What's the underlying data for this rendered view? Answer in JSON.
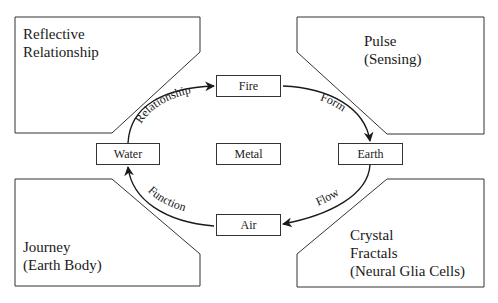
{
  "panels": {
    "top_left": {
      "line1": "Reflective",
      "line2": "Relationship"
    },
    "top_right": {
      "line1": "Pulse",
      "line2": "(Sensing)"
    },
    "bottom_left": {
      "line1": "Journey",
      "line2": "(Earth Body)"
    },
    "bottom_right": {
      "line1": "Crystal",
      "line2": "Fractals",
      "line3": "(Neural Glia Cells)"
    }
  },
  "nodes": {
    "fire": "Fire",
    "water": "Water",
    "metal": "Metal",
    "earth": "Earth",
    "air": "Air"
  },
  "arrows": {
    "water_to_fire": "Relationship",
    "fire_to_earth": "Form",
    "earth_to_air": "Flow",
    "air_to_water": "Function"
  }
}
